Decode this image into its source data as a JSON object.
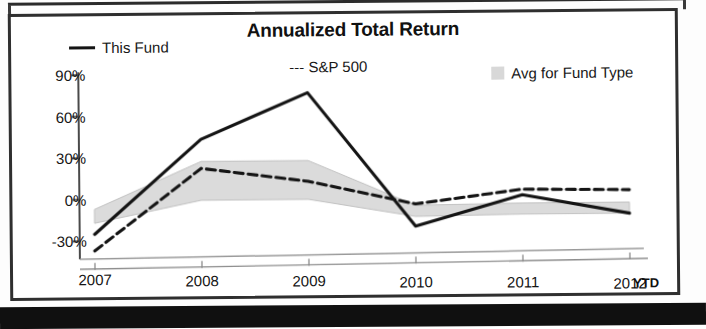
{
  "chart_data": {
    "type": "line",
    "title": "Annualized Total Return",
    "xlabel": "",
    "ylabel": "",
    "categories": [
      "2007",
      "2008",
      "2009",
      "2010",
      "2011",
      "2012"
    ],
    "last_period_note": "YTD",
    "ylim": [
      -40,
      90
    ],
    "yticks": [
      90,
      60,
      30,
      0,
      -30
    ],
    "ytick_labels": [
      "90%",
      "60%",
      "30%",
      "0%",
      "-30%"
    ],
    "grid": false,
    "legend_position": "top",
    "series": [
      {
        "name": "This Fund",
        "style": "solid",
        "color": "#141414",
        "values": [
          -25,
          43,
          76,
          -21,
          1,
          -13
        ]
      },
      {
        "name": "S&P 500",
        "style": "dashed",
        "color": "#141414",
        "values": [
          -37,
          22,
          12,
          -5,
          5,
          4
        ]
      },
      {
        "name": "Avg for Fund Type",
        "style": "band",
        "color": "#d8d8d8",
        "upper": [
          -7,
          27,
          27,
          -6,
          -5,
          -5
        ],
        "lower": [
          -17,
          -1,
          -1,
          -14,
          -13,
          -13
        ]
      }
    ]
  },
  "legend": {
    "this_fund": "This Fund",
    "sp500": "--- S&P 500",
    "avg_fund_type": "Avg for Fund Type"
  },
  "axis": {
    "y_labels": [
      "90%",
      "60%",
      "30%",
      "0%",
      "-30%"
    ],
    "x_labels": [
      "2007",
      "2008",
      "2009",
      "2010",
      "2011",
      "2012"
    ],
    "ytd": "YTD"
  }
}
